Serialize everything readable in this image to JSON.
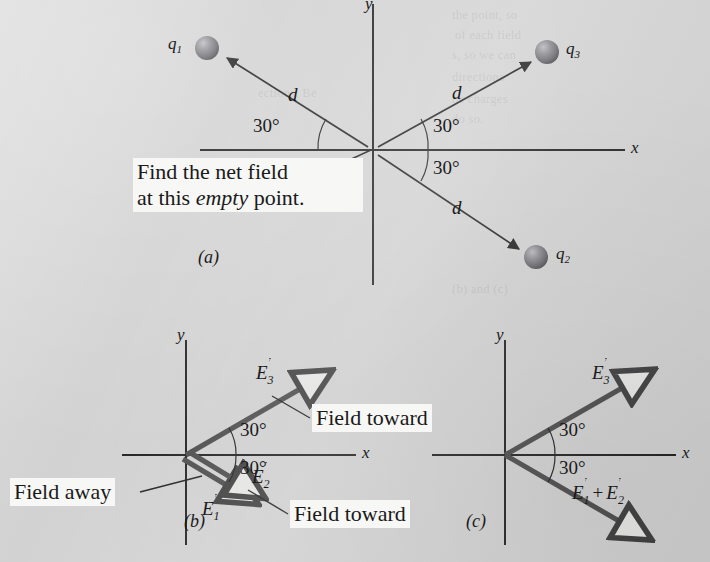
{
  "figure": {
    "background_color": "#d2d2d2",
    "ink_color": "#1a1a1a",
    "vector_color": "#4a4a4a",
    "callout_bg": "#f7f7f5"
  },
  "bleed_through": [
    {
      "text": "the point, so",
      "x": 452,
      "y": 8
    },
    {
      "text": "of each field",
      "x": 455,
      "y": 28
    },
    {
      "text": "s, so we can",
      "x": 452,
      "y": 48
    },
    {
      "text": "ections. Be",
      "x": 258,
      "y": 86
    },
    {
      "text": "directions",
      "x": 452,
      "y": 70
    },
    {
      "text": "he charges",
      "x": 452,
      "y": 92
    },
    {
      "text": "do so.",
      "x": 452,
      "y": 112
    },
    {
      "text": "(b) and (c)",
      "x": 452,
      "y": 282
    }
  ],
  "panels": [
    {
      "id": "a",
      "label": "(a)",
      "label_pos": {
        "x": 200,
        "y": 258
      },
      "axes": {
        "x_label": "x",
        "x_label_pos": {
          "x": 632,
          "y": 139
        },
        "y_label": "y",
        "y_label_pos": {
          "x": 365,
          "y": -4
        },
        "origin": {
          "x": 373,
          "y": 150
        },
        "x_from": {
          "x": 200,
          "y": 150
        },
        "x_to": {
          "x": 625,
          "y": 150
        },
        "y_from": {
          "x": 373,
          "y": 4
        },
        "y_to": {
          "x": 373,
          "y": 285
        }
      },
      "charges": [
        {
          "name": "q1",
          "label": "q",
          "sub": "1",
          "sphere": {
            "cx": 207,
            "cy": 48,
            "r": 12
          },
          "label_pos": {
            "x": 170,
            "y": 37
          },
          "arrow_from": {
            "x": 368,
            "y": 147
          },
          "arrow_to": {
            "x": 225,
            "y": 57
          },
          "d_label": "d",
          "d_label_pos": {
            "x": 290,
            "y": 95
          },
          "angle_label": "30°",
          "angle_label_pos": {
            "x": 278,
            "y": 123
          }
        },
        {
          "name": "q3",
          "label": "q",
          "sub": "3",
          "sphere": {
            "cx": 547,
            "cy": 52,
            "r": 12
          },
          "label_pos": {
            "x": 566,
            "y": 42
          },
          "arrow_from": {
            "x": 378,
            "y": 147
          },
          "arrow_to": {
            "x": 529,
            "y": 63
          },
          "d_label": "d",
          "d_label_pos": {
            "x": 453,
            "y": 93
          },
          "angle_label": "30°",
          "angle_label_pos": {
            "x": 434,
            "y": 123
          }
        },
        {
          "name": "q2",
          "label": "q",
          "sub": "2",
          "sphere": {
            "cx": 536,
            "cy": 257,
            "r": 12
          },
          "label_pos": {
            "x": 556,
            "y": 247
          },
          "arrow_from": {
            "x": 378,
            "y": 155
          },
          "arrow_to": {
            "x": 518,
            "y": 248
          },
          "d_label": "d",
          "d_label_pos": {
            "x": 452,
            "y": 208
          },
          "angle_label": "30°",
          "angle_label_pos": {
            "x": 434,
            "y": 168
          }
        }
      ],
      "callout": {
        "line1": "Find the net field",
        "line2_pre": "at this ",
        "line2_it": "empty",
        "line2_post": " point.",
        "box": {
          "x": 133,
          "y": 159,
          "w": 229,
          "h": 62
        },
        "leader_from": {
          "x": 310,
          "y": 178
        },
        "leader_to": {
          "x": 371,
          "y": 150
        }
      }
    },
    {
      "id": "b",
      "label": "(b)",
      "label_pos": {
        "x": 186,
        "y": 522
      },
      "axes": {
        "x_label": "x",
        "x_label_pos": {
          "x": 364,
          "y": 444
        },
        "y_label": "y",
        "y_label_pos": {
          "x": 178,
          "y": 328
        },
        "origin": {
          "x": 186,
          "y": 455
        },
        "x_from": {
          "x": 122,
          "y": 455
        },
        "x_to": {
          "x": 356,
          "y": 455
        },
        "y_from": {
          "x": 186,
          "y": 340
        },
        "y_to": {
          "x": 186,
          "y": 545
        }
      },
      "vectors": [
        {
          "name": "E3",
          "label": "E",
          "sub": "3",
          "from": {
            "x": 186,
            "y": 455
          },
          "to": {
            "x": 312,
            "y": 382
          },
          "label_pos": {
            "x": 258,
            "y": 368
          },
          "angle_label": "30°",
          "angle_label_pos": {
            "x": 222,
            "y": 428
          }
        },
        {
          "name": "E1",
          "label": "E",
          "sub": "1",
          "from": {
            "x": 184,
            "y": 458
          },
          "to": {
            "x": 240,
            "y": 492
          },
          "label_pos": {
            "x": 205,
            "y": 505
          }
        },
        {
          "name": "E2",
          "label": "E",
          "sub": "2",
          "from": {
            "x": 188,
            "y": 453
          },
          "to": {
            "x": 246,
            "y": 487
          },
          "label_pos": {
            "x": 255,
            "y": 473
          },
          "angle_label": "30°",
          "angle_label_pos": {
            "x": 226,
            "y": 478
          }
        }
      ],
      "callouts": [
        {
          "name": "field-toward-e3",
          "text": "Field toward",
          "box": {
            "x": 310,
            "y": 404,
            "w": 158,
            "h": 29
          },
          "leader_from": {
            "x": 310,
            "y": 418
          },
          "leader_to": {
            "x": 272,
            "y": 396
          }
        },
        {
          "name": "field-away-e1",
          "text": "Field away",
          "box": {
            "x": 8,
            "y": 478,
            "w": 131,
            "h": 29
          },
          "leader_from": {
            "x": 140,
            "y": 492
          },
          "leader_to": {
            "x": 202,
            "y": 476
          }
        },
        {
          "name": "field-toward-e2",
          "text": "Field toward",
          "box": {
            "x": 288,
            "y": 500,
            "w": 158,
            "h": 29
          },
          "leader_from": {
            "x": 288,
            "y": 514
          },
          "leader_to": {
            "x": 248,
            "y": 490
          }
        }
      ]
    },
    {
      "id": "c",
      "label": "(c)",
      "label_pos": {
        "x": 468,
        "y": 522
      },
      "axes": {
        "x_label": "x",
        "x_label_pos": {
          "x": 684,
          "y": 444
        },
        "y_label": "y",
        "y_label_pos": {
          "x": 497,
          "y": 328
        },
        "origin": {
          "x": 505,
          "y": 455
        },
        "x_from": {
          "x": 432,
          "y": 455
        },
        "x_to": {
          "x": 676,
          "y": 455
        },
        "y_from": {
          "x": 505,
          "y": 340
        },
        "y_to": {
          "x": 505,
          "y": 545
        }
      },
      "vectors": [
        {
          "name": "E3",
          "label": "E",
          "sub": "3",
          "from": {
            "x": 505,
            "y": 455
          },
          "to": {
            "x": 634,
            "y": 381
          },
          "label_pos": {
            "x": 594,
            "y": 368
          },
          "angle_label": "30°",
          "angle_label_pos": {
            "x": 543,
            "y": 428
          }
        },
        {
          "name": "E1plusE2",
          "label": "E",
          "sub": "1",
          "label2": "E",
          "sub2": "2",
          "from": {
            "x": 505,
            "y": 455
          },
          "to": {
            "x": 631,
            "y": 528
          },
          "label_pos": {
            "x": 577,
            "y": 488
          },
          "angle_label": "30°",
          "angle_label_pos": {
            "x": 543,
            "y": 478
          }
        }
      ]
    }
  ]
}
